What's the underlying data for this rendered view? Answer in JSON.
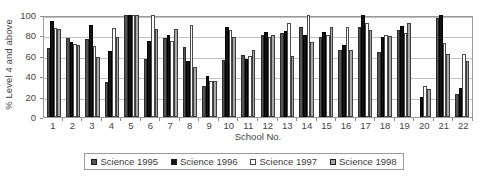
{
  "chart_data": {
    "type": "bar",
    "title": "",
    "xlabel": "School No.",
    "ylabel": "% Level 4 and above",
    "ylim": [
      0,
      100
    ],
    "yticks": [
      0,
      20,
      40,
      60,
      80,
      100
    ],
    "grid": true,
    "legend_position": "bottom",
    "categories": [
      "1",
      "2",
      "3",
      "4",
      "5",
      "6",
      "7",
      "8",
      "9",
      "10",
      "11",
      "12",
      "13",
      "14",
      "15",
      "16",
      "17",
      "18",
      "19",
      "20",
      "21",
      "22"
    ],
    "series": [
      {
        "name": "Science 1995",
        "color": "#545454",
        "values": [
          68,
          77,
          76,
          34,
          100,
          57,
          77,
          69,
          30,
          56,
          61,
          80,
          82,
          88,
          78,
          66,
          88,
          64,
          85,
          0,
          97,
          23
        ]
      },
      {
        "name": "Science 1996",
        "color": "#131313",
        "values": [
          94,
          74,
          90,
          65,
          100,
          75,
          80,
          55,
          40,
          88,
          57,
          83,
          84,
          80,
          83,
          71,
          100,
          78,
          89,
          20,
          100,
          28
        ]
      },
      {
        "name": "Science 1997",
        "color": "#ffffff",
        "values": [
          87,
          72,
          70,
          87,
          100,
          100,
          75,
          90,
          35,
          85,
          60,
          78,
          92,
          100,
          80,
          88,
          92,
          80,
          82,
          30,
          73,
          62
        ]
      },
      {
        "name": "Science 1998",
        "color": "#a8a8a8",
        "values": [
          86,
          71,
          59,
          78,
          100,
          86,
          86,
          49,
          35,
          78,
          66,
          80,
          60,
          74,
          88,
          66,
          85,
          79,
          92,
          27,
          62,
          55
        ]
      }
    ]
  },
  "axes": {
    "ylabel": "% Level 4 and above",
    "xlabel": "School No.",
    "ytick_labels": [
      "100",
      "80",
      "60",
      "40",
      "20",
      "0"
    ],
    "xtick_labels": [
      "1",
      "2",
      "3",
      "4",
      "5",
      "6",
      "7",
      "8",
      "9",
      "10",
      "11",
      "12",
      "13",
      "14",
      "15",
      "16",
      "17",
      "18",
      "19",
      "20",
      "21",
      "22"
    ]
  },
  "legend": {
    "items": [
      {
        "label": "Science 1995",
        "color": "#545454"
      },
      {
        "label": "Science 1996",
        "color": "#131313"
      },
      {
        "label": "Science 1997",
        "color": "#ffffff"
      },
      {
        "label": "Science 1998",
        "color": "#a8a8a8"
      }
    ]
  }
}
